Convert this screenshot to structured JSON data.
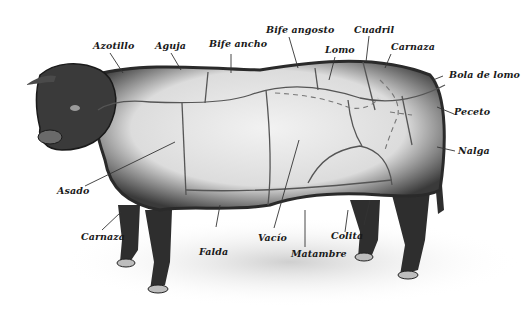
{
  "diagram": {
    "colors": {
      "background": "#ffffff",
      "body_fill": "#e6e6e6",
      "fur": "#2a2a2a",
      "cut_lines": "#555555",
      "label_text": "#1a1a1a"
    },
    "labels": [
      {
        "id": "azotillo",
        "text": "Azotillo"
      },
      {
        "id": "aguja",
        "text": "Aguja"
      },
      {
        "id": "bife-ancho",
        "text": "Bife ancho"
      },
      {
        "id": "bife-angosto",
        "text": "Bife angosto"
      },
      {
        "id": "lomo",
        "text": "Lomo"
      },
      {
        "id": "cuadril",
        "text": "Cuadril"
      },
      {
        "id": "carnaza-top",
        "text": "Carnaza"
      },
      {
        "id": "bola-de-lomo",
        "text": "Bola de lomo"
      },
      {
        "id": "peceto",
        "text": "Peceto"
      },
      {
        "id": "nalga",
        "text": "Nalga"
      },
      {
        "id": "asado",
        "text": "Asado"
      },
      {
        "id": "carnaza-bottom",
        "text": "Carnaza"
      },
      {
        "id": "falda",
        "text": "Falda"
      },
      {
        "id": "vacio",
        "text": "Vacío"
      },
      {
        "id": "matambre",
        "text": "Matambre"
      },
      {
        "id": "colita",
        "text": "Colita"
      }
    ]
  }
}
